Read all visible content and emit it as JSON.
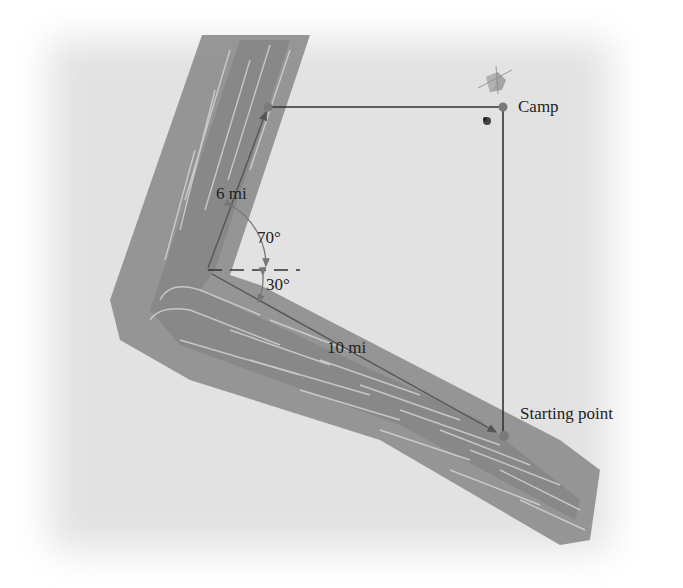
{
  "figure": {
    "labels": {
      "camp": "Camp",
      "start": "Starting point",
      "leg1_distance": "6 mi",
      "leg2_distance": "10 mi",
      "angle_upper": "70°",
      "angle_lower": "30°"
    },
    "colors": {
      "background": "#e6e6e6",
      "river": "#8e8e8e",
      "river_dark": "#7a7a7a",
      "ripple": "#d8d8d8",
      "line": "#3a3a3a",
      "dot": "#7a7a7a"
    },
    "icons": [
      "tent-icon",
      "campfire-icon"
    ]
  }
}
